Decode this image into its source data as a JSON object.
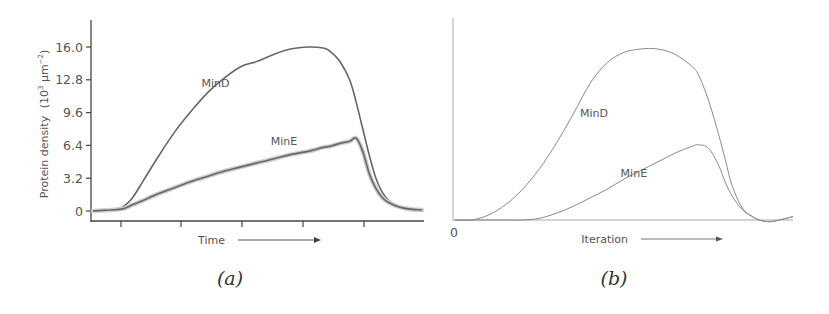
{
  "chart_data": [
    {
      "panel": "(a)",
      "type": "line",
      "title": "",
      "xlabel": "Time",
      "ylabel": "Protein density (10^3 µm^-2)",
      "ylabel_parts": {
        "main": "Protein density",
        "unit": "(10",
        "exp": "3",
        "unit2": " µm",
        "exp2": "−2",
        "close": ")"
      },
      "yticks": [
        "0",
        "3.2",
        "6.4",
        "9.6",
        "12.8",
        "16.0"
      ],
      "ylim": [
        0,
        17.5
      ],
      "xlim": [
        0,
        1
      ],
      "grid": false,
      "x": [
        0.0,
        0.05,
        0.09,
        0.12,
        0.15,
        0.2,
        0.25,
        0.3,
        0.35,
        0.4,
        0.45,
        0.5,
        0.55,
        0.6,
        0.65,
        0.7,
        0.72,
        0.75,
        0.78,
        0.8,
        0.82,
        0.84,
        0.86,
        0.88,
        0.9,
        0.93,
        0.96,
        1.0
      ],
      "series": [
        {
          "name": "MinD",
          "color": "#666666",
          "values": [
            0.0,
            0.1,
            0.4,
            1.3,
            2.8,
            5.4,
            7.8,
            9.8,
            11.6,
            13.0,
            14.1,
            14.6,
            15.3,
            15.8,
            16.0,
            15.9,
            15.6,
            14.6,
            12.8,
            10.6,
            8.0,
            5.4,
            3.2,
            1.8,
            1.0,
            0.5,
            0.3,
            0.1
          ]
        },
        {
          "name": "MinE",
          "color": "#666666",
          "values": [
            0.0,
            0.1,
            0.2,
            0.6,
            1.0,
            1.7,
            2.3,
            2.9,
            3.4,
            3.9,
            4.3,
            4.7,
            5.1,
            5.5,
            5.8,
            6.2,
            6.3,
            6.6,
            6.8,
            7.1,
            5.8,
            3.6,
            2.2,
            1.3,
            0.8,
            0.4,
            0.2,
            0.1
          ]
        }
      ],
      "annotations": [
        {
          "text": "MinD",
          "x": 0.33,
          "y": 12.1
        },
        {
          "text": "MinE",
          "x": 0.54,
          "y": 6.4
        }
      ],
      "xticks_count": 6,
      "arrow": "→ (increasing time)"
    },
    {
      "panel": "(b)",
      "type": "line",
      "title": "",
      "xlabel": "Iteration",
      "ylabel": "",
      "yticks": [
        "0"
      ],
      "ylim": [
        0,
        1.1
      ],
      "xlim": [
        0,
        1
      ],
      "grid": false,
      "x": [
        0.0,
        0.05,
        0.1,
        0.15,
        0.2,
        0.25,
        0.3,
        0.35,
        0.4,
        0.45,
        0.5,
        0.55,
        0.6,
        0.65,
        0.7,
        0.72,
        0.75,
        0.78,
        0.8,
        0.82,
        0.85,
        0.88,
        0.9,
        0.93,
        0.96,
        1.0
      ],
      "series": [
        {
          "name": "MinD",
          "color": "#8a8a8a",
          "values": [
            0.0,
            0.0,
            0.03,
            0.09,
            0.18,
            0.3,
            0.45,
            0.62,
            0.8,
            0.92,
            0.98,
            1.0,
            1.0,
            0.97,
            0.9,
            0.85,
            0.7,
            0.5,
            0.35,
            0.2,
            0.07,
            0.02,
            0.0,
            -0.01,
            0.0,
            0.02
          ]
        },
        {
          "name": "MinE",
          "color": "#8a8a8a",
          "values": [
            0.0,
            0.0,
            0.0,
            0.0,
            0.0,
            0.01,
            0.04,
            0.08,
            0.13,
            0.18,
            0.24,
            0.29,
            0.34,
            0.39,
            0.43,
            0.44,
            0.42,
            0.32,
            0.22,
            0.14,
            0.06,
            0.02,
            0.0,
            -0.01,
            0.0,
            0.02
          ]
        }
      ],
      "annotations": [
        {
          "text": "MinD",
          "x": 0.37,
          "y": 0.6
        },
        {
          "text": "MinE",
          "x": 0.49,
          "y": 0.25
        }
      ],
      "arrow": "→ (increasing iteration)"
    }
  ],
  "captions": {
    "a": "(a)",
    "b": "(b)"
  }
}
